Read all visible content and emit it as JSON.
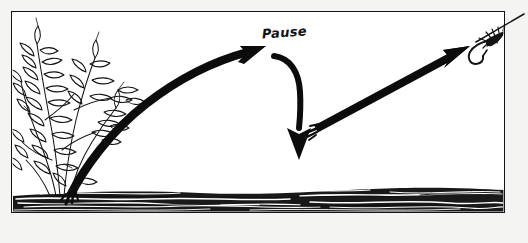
{
  "illustration": {
    "title": "Fishing lure retrieve diagram",
    "caption_text": "Pause",
    "background_color": "#ffffff",
    "page_color": "#f4f4f2",
    "ink_color": "#141414",
    "frame": {
      "name": "panel-border",
      "x": 11,
      "y": 11,
      "width": 494,
      "height": 202,
      "stroke_width": 1.6
    },
    "elements": {
      "bush_label": "streamside bush",
      "water_label": "water surface line",
      "arrow_rise_label": "rising retrieve arrow",
      "arrow_drop_label": "sinking pause arrow",
      "arrow_lift_label": "lift to fly arrow",
      "fly_label": "fishing fly on tippet",
      "line_label": "fishing line"
    }
  }
}
